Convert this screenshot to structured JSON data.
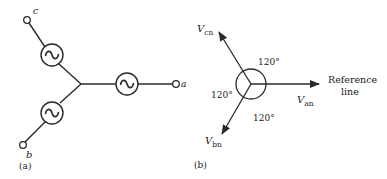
{
  "panel_a": {
    "caption": "(a)",
    "terminals": {
      "a": "a",
      "b": "b",
      "c": "c"
    },
    "source_symbol": "~",
    "sources_count": 3
  },
  "panel_b": {
    "caption": "(b)",
    "phasors": {
      "van": {
        "main": "V",
        "sub": "an"
      },
      "vbn": {
        "main": "V",
        "sub": "bn"
      },
      "vcn": {
        "main": "V",
        "sub": "cn"
      }
    },
    "angles": {
      "top": "120°",
      "left": "120°",
      "bottom": "120°"
    },
    "reference": {
      "line1": "Reference",
      "line2": "line"
    }
  },
  "colors": {
    "stroke": "#2a2a2a",
    "text": "#1a1a1a",
    "background": "#ffffff"
  }
}
